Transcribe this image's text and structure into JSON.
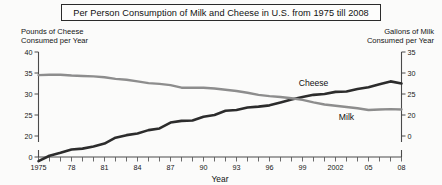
{
  "title": "Per Person Consumption of Milk and Cheese in U.S. from 1975 till 2008",
  "left_axis_caption_line1": "Pounds of Cheese",
  "left_axis_caption_line2": "Consumed per Year",
  "right_axis_caption_line1": "Gallons of Milk",
  "right_axis_caption_line2": "Consumed per Year",
  "chart_data": {
    "type": "line",
    "title": "Per Person Consumption of Milk and Cheese in U.S. from 1975 till 2008",
    "xlabel": "Year",
    "ylabel": "Pounds of Cheese Consumed per Year",
    "y2label": "Gallons of Milk Consumed per Year",
    "grid": false,
    "legend": "inline-series-labels",
    "xlim": [
      1975,
      2008
    ],
    "ylim": [
      0,
      40
    ],
    "y2lim": [
      0,
      35
    ],
    "yticks": [
      0,
      20,
      25,
      30,
      35,
      40
    ],
    "ytick_labels": [
      "0",
      "20",
      "25",
      "30",
      "35",
      "40"
    ],
    "y2ticks": [
      0,
      20,
      25,
      30,
      35
    ],
    "y2tick_labels": [
      "0",
      "20",
      "25",
      "30",
      "35"
    ],
    "axis_break": true,
    "xticks": [
      1975,
      1976,
      1977,
      1978,
      1979,
      1980,
      1981,
      1982,
      1983,
      1984,
      1985,
      1986,
      1987,
      1988,
      1989,
      1990,
      1991,
      1992,
      1993,
      1994,
      1995,
      1996,
      1997,
      1998,
      1999,
      2000,
      2001,
      2002,
      2003,
      2004,
      2005,
      2006,
      2007,
      2008
    ],
    "xtick_labels": [
      "1975",
      "",
      "",
      "78",
      "",
      "",
      "81",
      "",
      "",
      "84",
      "",
      "",
      "87",
      "",
      "",
      "90",
      "",
      "",
      "93",
      "",
      "",
      "96",
      "",
      "",
      "99",
      "",
      "",
      "2002",
      "",
      "",
      "05",
      "",
      "",
      "08"
    ],
    "x": [
      1975,
      1976,
      1977,
      1978,
      1979,
      1980,
      1981,
      1982,
      1983,
      1984,
      1985,
      1986,
      1987,
      1988,
      1989,
      1990,
      1991,
      1992,
      1993,
      1994,
      1995,
      1996,
      1997,
      1998,
      1999,
      2000,
      2001,
      2002,
      2003,
      2004,
      2005,
      2006,
      2007,
      2008
    ],
    "series": [
      {
        "name": "Cheese",
        "color": "#2c2c2c",
        "units": "pounds per person per year",
        "axis": "left",
        "values": [
          14.0,
          15.3,
          16.0,
          16.8,
          17.0,
          17.5,
          18.2,
          19.6,
          20.2,
          20.6,
          21.4,
          21.8,
          23.2,
          23.6,
          23.7,
          24.6,
          25.0,
          26.0,
          26.2,
          26.8,
          27.0,
          27.3,
          28.0,
          28.7,
          29.3,
          29.8,
          30.0,
          30.5,
          30.6,
          31.2,
          31.6,
          32.3,
          33.0,
          32.5
        ]
      },
      {
        "name": "Milk",
        "color": "#8d8d8d",
        "units": "gallons per person per year",
        "axis": "right",
        "values": [
          29.5,
          29.6,
          29.6,
          29.4,
          29.3,
          29.2,
          29.0,
          28.6,
          28.4,
          28.0,
          27.6,
          27.4,
          27.1,
          26.5,
          26.5,
          26.5,
          26.3,
          26.0,
          25.7,
          25.3,
          24.8,
          24.5,
          24.3,
          24.0,
          23.6,
          23.0,
          22.5,
          22.2,
          21.9,
          21.6,
          21.2,
          21.3,
          21.4,
          21.3
        ]
      }
    ],
    "annotations": [
      {
        "text": "Cheese",
        "x": 2000,
        "series": "Cheese"
      },
      {
        "text": "Milk",
        "x": 2003,
        "series": "Milk"
      }
    ]
  },
  "x_axis_title": "Year",
  "series_labels": {
    "cheese": "Cheese",
    "milk": "Milk"
  }
}
